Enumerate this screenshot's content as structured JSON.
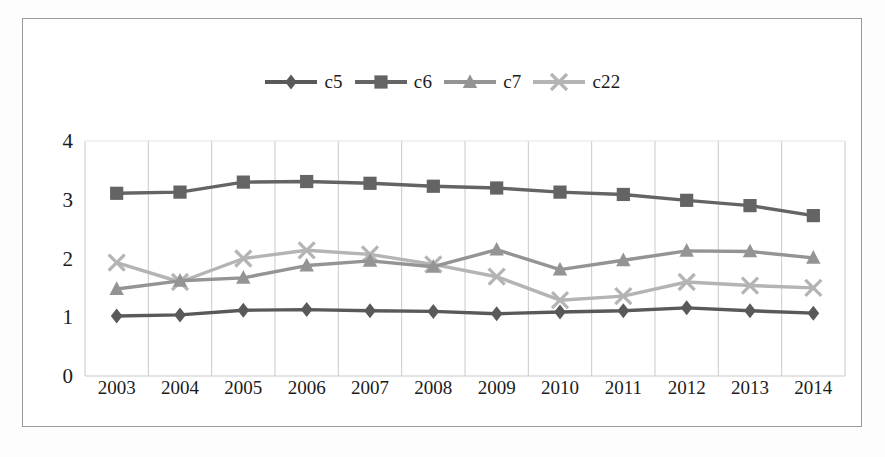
{
  "chart_data": {
    "type": "line",
    "title": "",
    "subtitle": "",
    "xlabel": "",
    "ylabel": "",
    "categories": [
      "2003",
      "2004",
      "2005",
      "2006",
      "2007",
      "2008",
      "2009",
      "2010",
      "2011",
      "2012",
      "2013",
      "2014"
    ],
    "ylim": [
      0,
      4
    ],
    "yticks": [
      0,
      1,
      2,
      3,
      4
    ],
    "ytick_labels": [
      "0",
      "1",
      "2",
      "3",
      "4"
    ],
    "grid": "vertical",
    "legend_position": "top-center",
    "series": [
      {
        "name": "c5",
        "marker": "diamond",
        "color": "#595959",
        "values": [
          1.02,
          1.04,
          1.12,
          1.13,
          1.11,
          1.1,
          1.06,
          1.09,
          1.11,
          1.16,
          1.11,
          1.07
        ]
      },
      {
        "name": "c6",
        "marker": "square",
        "color": "#646464",
        "values": [
          3.11,
          3.13,
          3.3,
          3.31,
          3.28,
          3.23,
          3.2,
          3.13,
          3.09,
          2.99,
          2.9,
          2.73
        ]
      },
      {
        "name": "c7",
        "marker": "triangle",
        "color": "#949494",
        "values": [
          1.48,
          1.62,
          1.67,
          1.88,
          1.96,
          1.86,
          2.15,
          1.81,
          1.97,
          2.13,
          2.12,
          2.01
        ]
      },
      {
        "name": "c22",
        "marker": "cross",
        "color": "#b4b4b4",
        "values": [
          1.93,
          1.6,
          2.0,
          2.14,
          2.07,
          1.9,
          1.69,
          1.29,
          1.36,
          1.6,
          1.54,
          1.5
        ]
      }
    ]
  },
  "legend": {
    "items": [
      {
        "label": "c5"
      },
      {
        "label": "c6"
      },
      {
        "label": "c7"
      },
      {
        "label": "c22"
      }
    ]
  },
  "colors": {
    "c5": "#595959",
    "c6": "#646464",
    "c7": "#949494",
    "c22": "#b4b4b4",
    "grid": "#c9c9c9",
    "frame": "#9a9a9a",
    "text": "#1b1b1b",
    "background": "#ffffff"
  }
}
